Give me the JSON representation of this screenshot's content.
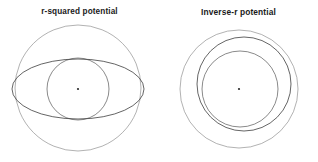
{
  "figure": {
    "width": 318,
    "height": 162,
    "background_color": "#ffffff",
    "stroke_color": "#4a4a4a",
    "caption_color": "#1a1a1a"
  },
  "panels": [
    {
      "id": "r-squared",
      "title": "r-squared potential",
      "center_marker_label": "center",
      "curves": [
        {
          "name": "outer-circle",
          "shape": "circle",
          "cx": 78,
          "cy": 88,
          "r": 63,
          "weight": "faint"
        },
        {
          "name": "orbit-ellipse",
          "shape": "ellipse",
          "cx": 78,
          "cy": 89,
          "rx": 66,
          "ry": 30,
          "weight": "strong"
        },
        {
          "name": "inner-circle",
          "shape": "circle",
          "cx": 78,
          "cy": 89,
          "r": 31,
          "weight": "normal"
        }
      ],
      "focus": {
        "cx": 78,
        "cy": 89,
        "r": 1.1
      }
    },
    {
      "id": "inverse-r",
      "title": "Inverse-r potential",
      "center_marker_label": "center",
      "curves": [
        {
          "name": "outer-circle",
          "shape": "circle",
          "cx": 239,
          "cy": 89,
          "r": 59,
          "weight": "faint"
        },
        {
          "name": "middle-circle",
          "shape": "circle",
          "cx": 244,
          "cy": 84,
          "r": 47,
          "weight": "strong"
        },
        {
          "name": "inner-circle",
          "shape": "circle",
          "cx": 240,
          "cy": 89,
          "r": 38,
          "weight": "normal"
        }
      ],
      "focus": {
        "cx": 239,
        "cy": 89,
        "r": 1.1
      }
    }
  ],
  "chart_data": {
    "type": "line",
    "title": "",
    "subtitle": "",
    "xlabel": "",
    "ylabel": "",
    "grid": false,
    "legend": "none",
    "panels": [
      {
        "label": "r-squared potential",
        "curves": [
          {
            "name": "outer-circle",
            "kind": "circle",
            "center": [
              78,
              88
            ],
            "radius": 63
          },
          {
            "name": "orbit-ellipse",
            "kind": "ellipse",
            "center": [
              78,
              89
            ],
            "semi_major": 66,
            "semi_minor": 30
          },
          {
            "name": "inner-circle",
            "kind": "circle",
            "center": [
              78,
              89
            ],
            "radius": 31
          }
        ],
        "focus_point": [
          78,
          89
        ]
      },
      {
        "label": "Inverse-r potential",
        "curves": [
          {
            "name": "outer-circle",
            "kind": "circle",
            "center": [
              239,
              89
            ],
            "radius": 59
          },
          {
            "name": "middle-circle",
            "kind": "circle",
            "center": [
              244,
              84
            ],
            "radius": 47
          },
          {
            "name": "inner-circle",
            "kind": "circle",
            "center": [
              240,
              89
            ],
            "radius": 38
          }
        ],
        "focus_point": [
          239,
          89
        ]
      }
    ]
  }
}
